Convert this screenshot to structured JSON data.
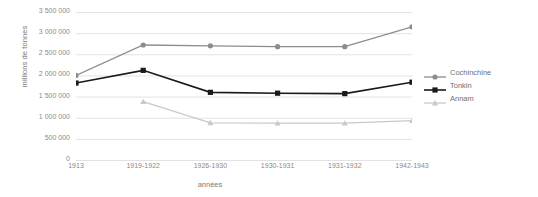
{
  "chart_data": {
    "type": "line",
    "title": "",
    "xlabel": "années",
    "ylabel": "millions de tonnes",
    "categories": [
      "1913",
      "1919-1922",
      "1926-1930",
      "1930-1931",
      "1931-1932",
      "1942-1943"
    ],
    "series": [
      {
        "name": "Cochinchine",
        "color": "#8c8c8c",
        "marker": "circle",
        "values": [
          2000000,
          2720000,
          2700000,
          2680000,
          2680000,
          3150000
        ]
      },
      {
        "name": "Tonkin",
        "color": "#1a1a1a",
        "marker": "square",
        "values": [
          1820000,
          2120000,
          1600000,
          1580000,
          1570000,
          1840000
        ]
      },
      {
        "name": "Annam",
        "color": "#c9c9c9",
        "marker": "triangle",
        "values": [
          null,
          1380000,
          880000,
          870000,
          870000,
          930000
        ]
      }
    ],
    "ylim": [
      0,
      3500000
    ],
    "yticks": [
      0,
      500000,
      1000000,
      1500000,
      2000000,
      2500000,
      3000000,
      3500000
    ],
    "ytick_labels": [
      "0",
      "500 000",
      "1 000 000",
      "1 500 000",
      "2 000 000",
      "2 500 000",
      "3 000 000",
      "3 500 000"
    ],
    "grid": {
      "horizontal": true,
      "vertical": false,
      "color": "#e2e2e2"
    },
    "legend": {
      "position": "right",
      "entries": [
        "Cochinchine",
        "Tonkin",
        "Annam"
      ]
    }
  }
}
